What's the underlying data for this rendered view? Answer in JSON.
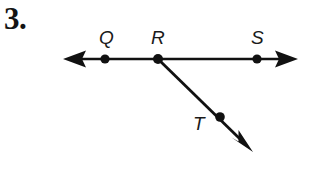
{
  "figure": {
    "problem_number": "3.",
    "stroke_color": "#111111",
    "background_color": "#ffffff",
    "labels": [
      {
        "id": "Q",
        "text": "Q",
        "x": 105,
        "y": 38
      },
      {
        "id": "R",
        "text": "R",
        "x": 159,
        "y": 38
      },
      {
        "id": "S",
        "text": "S",
        "x": 258,
        "y": 38
      },
      {
        "id": "T",
        "text": "T",
        "x": 199,
        "y": 124
      }
    ],
    "points": [
      {
        "id": "Q",
        "x": 105,
        "y": 59,
        "radius": 4.6
      },
      {
        "id": "R",
        "x": 158,
        "y": 59,
        "radius": 5.0
      },
      {
        "id": "S",
        "x": 257,
        "y": 59,
        "radius": 4.6
      },
      {
        "id": "T",
        "x": 220,
        "y": 117,
        "radius": 4.8
      }
    ],
    "segments": [
      {
        "id": "line-QS",
        "from": {
          "x": 63,
          "y": 59
        },
        "to": {
          "x": 298,
          "y": 59
        },
        "stroke_width": 2.6,
        "arrow_start": true,
        "arrow_end": true
      },
      {
        "id": "ray-RT",
        "from": {
          "x": 158,
          "y": 59
        },
        "to": {
          "x": 253,
          "y": 152
        },
        "stroke_width": 2.8,
        "arrow_start": false,
        "arrow_end": true
      }
    ]
  }
}
